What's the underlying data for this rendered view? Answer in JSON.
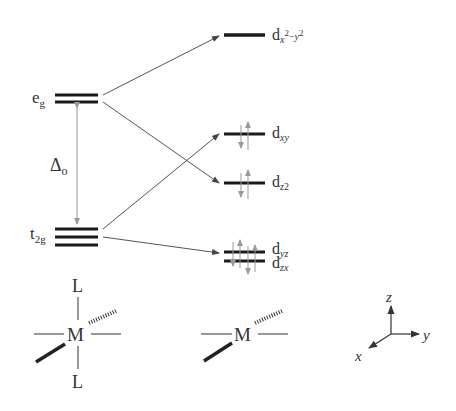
{
  "diagram": {
    "type": "crystal-field-splitting",
    "left_levels": {
      "eg": {
        "base": "e",
        "sub": "g"
      },
      "t2g": {
        "base": "t",
        "sub": "2g"
      },
      "splitting": {
        "symbol": "Δ",
        "sub": "o"
      }
    },
    "right_levels": [
      {
        "id": "dx2-y2",
        "base": "d",
        "sub": "x",
        "sup1": "2",
        "minus": "−",
        "sub2": "y",
        "sup2": "2",
        "electrons": 0
      },
      {
        "id": "dxy",
        "base": "d",
        "sub": "xy",
        "electrons": 2
      },
      {
        "id": "dz2",
        "base": "d",
        "sub": "z",
        "sup": "2",
        "electrons": 2
      },
      {
        "id": "dyz",
        "base": "d",
        "sub": "yz",
        "electrons": 2
      },
      {
        "id": "dzx",
        "base": "d",
        "sub": "zx",
        "electrons": 2
      }
    ],
    "octahedral_complex": {
      "metal": "M",
      "axial_top": "L",
      "axial_bottom": "L"
    },
    "square_planar_complex": {
      "metal": "M"
    },
    "axes": {
      "z": "z",
      "y": "y",
      "x": "x"
    },
    "colors": {
      "level": "#1a1a1a",
      "connector": "#555555",
      "arrow": "#888888",
      "text": "#333333"
    }
  }
}
